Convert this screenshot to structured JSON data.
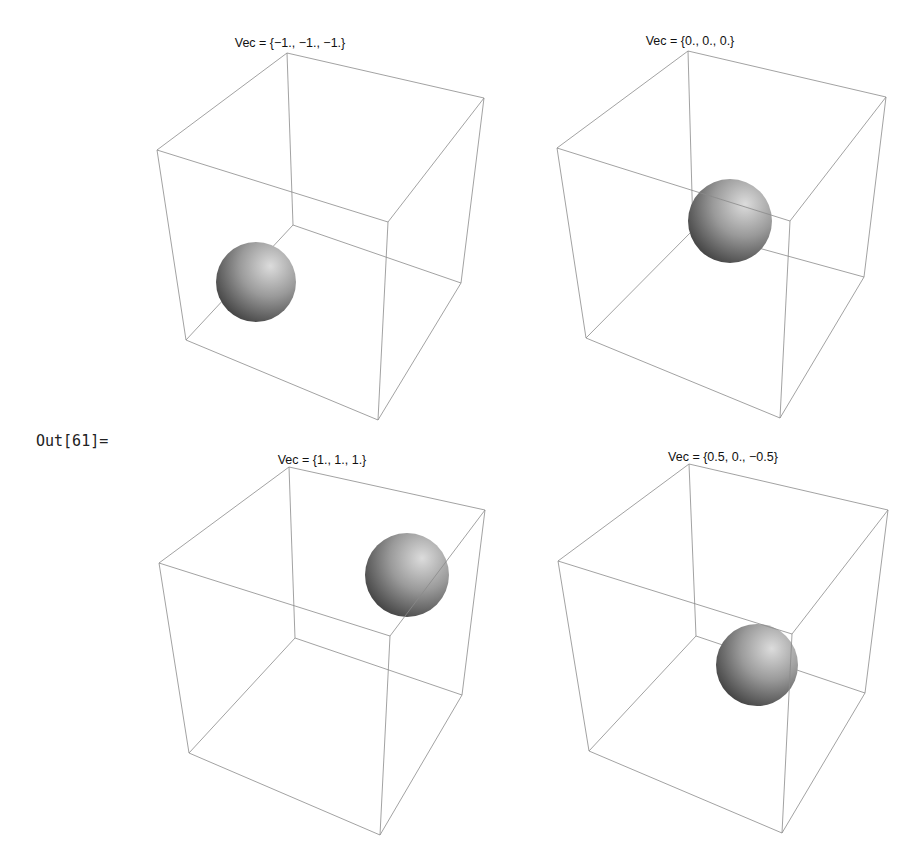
{
  "output_label": "Out[61]=",
  "panels": [
    {
      "title": "Vec = {−1., −1., −1.}",
      "vec": [
        -1,
        -1,
        -1
      ]
    },
    {
      "title": "Vec = {0., 0., 0.}",
      "vec": [
        0,
        0,
        0
      ]
    },
    {
      "title": "Vec = {1., 1., 1.}",
      "vec": [
        1,
        1,
        1
      ]
    },
    {
      "title": "Vec = {0.5, 0., −0.5}",
      "vec": [
        0.5,
        0,
        -0.5
      ]
    }
  ],
  "colors": {
    "edge": "#8a8a8a",
    "sphere_light": "#d8d8d8",
    "sphere_dark": "#3a3a3a",
    "background": "#ffffff"
  }
}
